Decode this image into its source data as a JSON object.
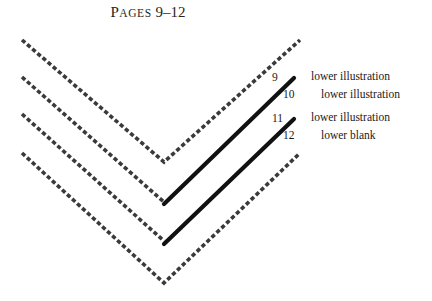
{
  "figure": {
    "title_first_letter": "P",
    "title_small_caps": "AGES",
    "title_range": " 9–12",
    "title_full": "PAGES 9–12",
    "width": 432,
    "height": 301,
    "background_color": "#ffffff"
  },
  "colors": {
    "dashed_fold": "#3a3a3a",
    "solid_leaf": "#111111",
    "text": "#1a1a1a",
    "title": "#262626"
  },
  "legend": {
    "rows": [
      {
        "number": "9",
        "label": "lower illustration",
        "indented": false
      },
      {
        "number": "10",
        "label": "lower illustration",
        "indented": true
      },
      {
        "number": "11",
        "label": "lower illustration",
        "indented": false
      },
      {
        "number": "12",
        "label": "lower blank",
        "indented": true
      }
    ]
  },
  "folds": {
    "dashed": [
      {
        "name": "outer-fold-top",
        "left_x": 22,
        "left_y": 40,
        "vertex_x": 164,
        "vertex_y": 162,
        "right_x": 300,
        "right_y": 40
      },
      {
        "name": "fold-page-9-10",
        "left_x": 22,
        "left_y": 77,
        "vertex_x": 164,
        "vertex_y": 202,
        "right_x": 164,
        "right_y": 202
      },
      {
        "name": "fold-page-11-12",
        "left_x": 22,
        "left_y": 114,
        "vertex_x": 164,
        "vertex_y": 241,
        "right_x": 164,
        "right_y": 241
      },
      {
        "name": "outer-fold-bottom",
        "left_x": 22,
        "left_y": 153,
        "vertex_x": 164,
        "vertex_y": 283,
        "right_x": 300,
        "right_y": 153
      }
    ],
    "solid": [
      {
        "name": "leaf-9-10",
        "start_x": 164,
        "start_y": 204,
        "end_x": 294,
        "end_y": 78
      },
      {
        "name": "leaf-11-12",
        "start_x": 164,
        "start_y": 244,
        "end_x": 294,
        "end_y": 119
      }
    ]
  }
}
